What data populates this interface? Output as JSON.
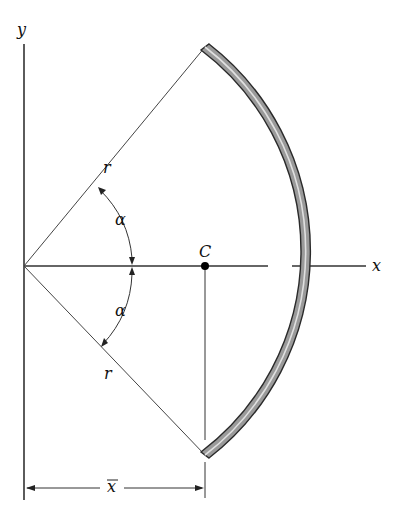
{
  "diagram": {
    "labels": {
      "y_axis": "y",
      "x_axis": "x",
      "radius_upper": "r",
      "radius_lower": "r",
      "angle_upper": "α",
      "angle_lower": "α",
      "centroid": "C",
      "xbar": "x"
    },
    "colors": {
      "line": "#333333",
      "arc_fill": "#9a9a9a",
      "arc_edge": "#2a2a2a",
      "centroid": "#000000"
    }
  }
}
